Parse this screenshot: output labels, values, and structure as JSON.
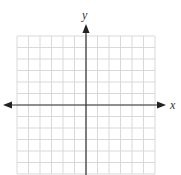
{
  "diagram": {
    "type": "coordinate-plane",
    "x_axis_label": "x",
    "y_axis_label": "y",
    "grid": {
      "columns": 12,
      "rows_above_x_axis": 6,
      "rows_below_x_axis": 6,
      "line_color": "#d9d9d9",
      "axis_color": "#333333"
    }
  }
}
